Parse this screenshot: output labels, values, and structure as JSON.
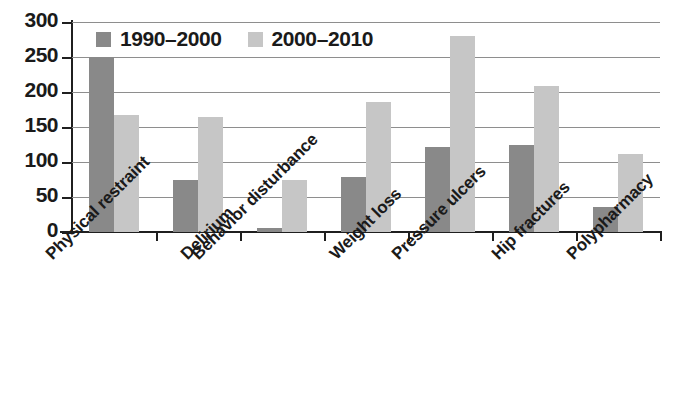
{
  "chart_data": {
    "type": "bar",
    "title": "",
    "xlabel": "",
    "ylabel": "",
    "ylim": [
      0,
      300
    ],
    "yticks": [
      0,
      50,
      100,
      150,
      200,
      250,
      300
    ],
    "grid": true,
    "legend_position": "top-left-inside",
    "categories": [
      "Physical restraint",
      "Delirium",
      "Behavior disturbance",
      "Weight loss",
      "Pressure ulcers",
      "Hip fractures",
      "Polypharmacy"
    ],
    "series": [
      {
        "name": "1990–2000",
        "color": "#898989",
        "values": [
          250,
          75,
          6,
          78,
          122,
          124,
          36
        ]
      },
      {
        "name": "2000–2010",
        "color": "#c6c6c6",
        "values": [
          167,
          164,
          75,
          186,
          280,
          208,
          112
        ]
      }
    ]
  },
  "axis": {
    "y_tick_labels": [
      "300",
      "250",
      "200",
      "150",
      "100",
      "50",
      "0"
    ]
  },
  "colors": {
    "series_1990_2000": "#898989",
    "series_2000_2010": "#c6c6c6",
    "axis": "#1f1f1f",
    "gridline": "#8e8e8e",
    "background": "#ffffff"
  }
}
